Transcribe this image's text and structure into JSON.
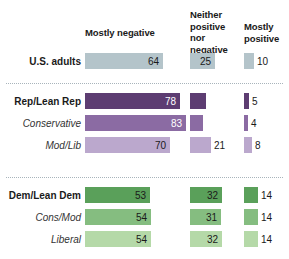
{
  "chart_data": {
    "type": "bar",
    "title": "",
    "orientation": "horizontal",
    "layout": "grouped-stacked-columns",
    "xlabel": "",
    "ylabel": "",
    "grid": false,
    "legend_position": "top-as-column-headers",
    "value_unit": "percent",
    "columns": [
      {
        "key": "mostly_negative",
        "label": "Mostly negative"
      },
      {
        "key": "neither",
        "label": "Neither positive nor negative"
      },
      {
        "key": "mostly_positive",
        "label": "Mostly positive"
      }
    ],
    "categories": [
      "U.S. adults",
      "Rep/Lean Rep",
      "Conservative",
      "Mod/Lib",
      "Dem/Lean Dem",
      "Cons/Mod",
      "Liberal"
    ],
    "series": [
      {
        "name": "Mostly negative",
        "values": [
          64,
          78,
          83,
          70,
          53,
          54,
          54
        ]
      },
      {
        "name": "Neither positive nor negative",
        "values": [
          25,
          16,
          13,
          21,
          32,
          31,
          32
        ]
      },
      {
        "name": "Mostly positive",
        "values": [
          10,
          5,
          4,
          8,
          14,
          14,
          14
        ]
      }
    ]
  },
  "headers": {
    "mostly_negative": "Mostly negative",
    "neither_line1": "Neither",
    "neither_line2": "positive nor",
    "neither_line3": "negative",
    "mostly_positive_line1": "Mostly",
    "mostly_positive_line2": "positive"
  },
  "colors": {
    "group_us": "#b4c4ca",
    "group_rep_dark": "#5d3d72",
    "group_rep_mid": "#8b6ba3",
    "group_rep_light": "#bba8cd",
    "group_dem_dark": "#5aa05a",
    "group_dem_mid": "#85bd80",
    "group_dem_light": "#b5d9a8",
    "text": "#1a1a1a",
    "value_on_dark": "#ffffff",
    "separator": "#a8b4bb"
  },
  "rows": [
    {
      "label": "U.S. adults",
      "style": "bold",
      "color": "#b4c4ca",
      "neg": "64",
      "neg_text": "dark",
      "neither": "25",
      "neither_text": "dark",
      "pos": "10",
      "pos_text": "dark"
    },
    {
      "label": "Rep/Lean Rep",
      "style": "bold",
      "color": "#5d3d72",
      "neg": "78",
      "neg_text": "light",
      "neither": "16",
      "neither_text": "light",
      "pos": "5",
      "pos_text": "dark"
    },
    {
      "label": "Conservative",
      "style": "italic",
      "color": "#8b6ba3",
      "neg": "83",
      "neg_text": "light",
      "neither": "13",
      "neither_text": "light",
      "pos": "4",
      "pos_text": "dark"
    },
    {
      "label": "Mod/Lib",
      "style": "italic",
      "color": "#bba8cd",
      "neg": "70",
      "neg_text": "dark",
      "neither": "21",
      "neither_text": "dark",
      "pos": "8",
      "pos_text": "dark"
    },
    {
      "label": "Dem/Lean Dem",
      "style": "bold",
      "color": "#5aa05a",
      "neg": "53",
      "neg_text": "dark",
      "neither": "32",
      "neither_text": "dark",
      "pos": "14",
      "pos_text": "dark"
    },
    {
      "label": "Cons/Mod",
      "style": "italic",
      "color": "#85bd80",
      "neg": "54",
      "neg_text": "dark",
      "neither": "31",
      "neither_text": "dark",
      "pos": "14",
      "pos_text": "dark"
    },
    {
      "label": "Liberal",
      "style": "italic",
      "color": "#b5d9a8",
      "neg": "54",
      "neg_text": "dark",
      "neither": "32",
      "neither_text": "dark",
      "pos": "14",
      "pos_text": "dark"
    }
  ]
}
